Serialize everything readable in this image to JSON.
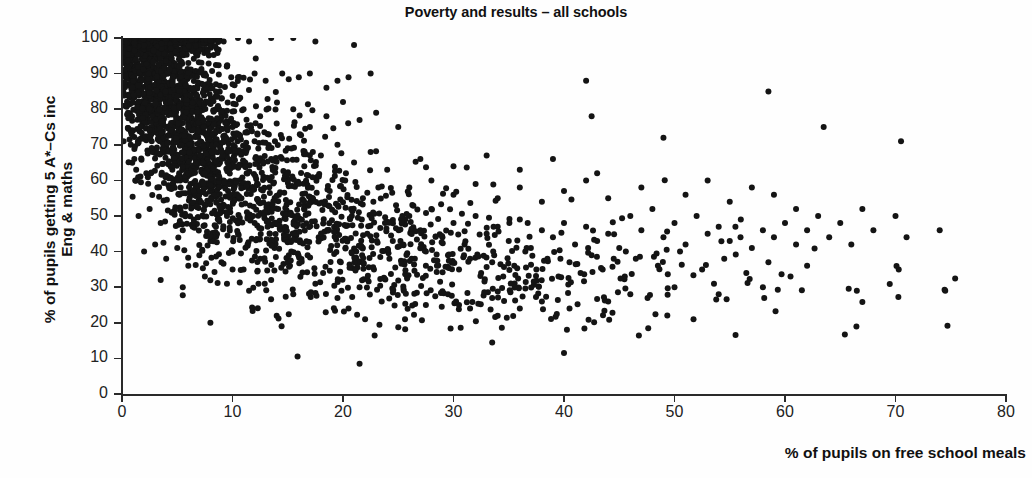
{
  "chart_data": {
    "type": "scatter",
    "title": "Poverty and results – all schools",
    "xlabel": "% of pupils on free school meals",
    "ylabel": "% of pupils getting 5 A*–Cs inc\nEng & maths",
    "xlim": [
      0,
      80
    ],
    "ylim": [
      0,
      100
    ],
    "xticks": [
      0,
      10,
      20,
      30,
      40,
      50,
      60,
      70,
      80
    ],
    "yticks": [
      0,
      10,
      20,
      30,
      40,
      50,
      60,
      70,
      80,
      90,
      100
    ],
    "grid": false,
    "legend": null,
    "marker": {
      "shape": "circle",
      "color": "#141414",
      "size_px": 6
    },
    "n_points_approx": 2900,
    "relationship": "strong negative correlation: school attainment falls as free-school-meal rate rises",
    "notes": [
      "Saturated band of points at y=100 for x between 0 and 6",
      "Dense cloud for x < 15 spanning y 30-100",
      "Main band narrows to y 30-55 for x between 25 and 45",
      "Sparse long tail of points out to x = 75 at y 28-75",
      "Low outliers near (21.5, 8.5), (33.5, 14.5) and (40, 11.5)"
    ],
    "points": [
      [
        0.2,
        100
      ],
      [
        0.4,
        100
      ],
      [
        0.6,
        100
      ],
      [
        0.8,
        100
      ],
      [
        1.0,
        100
      ],
      [
        1.2,
        100
      ],
      [
        1.4,
        100
      ],
      [
        1.6,
        100
      ],
      [
        1.8,
        100
      ],
      [
        2.0,
        100
      ],
      [
        2.2,
        100
      ],
      [
        2.4,
        100
      ],
      [
        2.6,
        100
      ],
      [
        2.8,
        100
      ],
      [
        3.0,
        100
      ],
      [
        3.2,
        100
      ],
      [
        3.4,
        100
      ],
      [
        3.6,
        100
      ],
      [
        3.8,
        100
      ],
      [
        4.0,
        100
      ],
      [
        4.2,
        100
      ],
      [
        4.4,
        100
      ],
      [
        4.6,
        100
      ],
      [
        4.8,
        100
      ],
      [
        5.0,
        100
      ],
      [
        5.2,
        100
      ],
      [
        5.4,
        100
      ],
      [
        5.6,
        100
      ],
      [
        5.8,
        100
      ],
      [
        6.0,
        100
      ],
      [
        6.4,
        100
      ],
      [
        7.0,
        100
      ],
      [
        7.6,
        100
      ],
      [
        8.4,
        100
      ],
      [
        9.2,
        99
      ],
      [
        10.5,
        100
      ],
      [
        11.5,
        99
      ],
      [
        13.5,
        100
      ],
      [
        15.5,
        100
      ],
      [
        17.5,
        99
      ],
      [
        21.0,
        98
      ],
      [
        0.4,
        94
      ],
      [
        1.2,
        96
      ],
      [
        2.0,
        97
      ],
      [
        2.8,
        95
      ],
      [
        3.6,
        96
      ],
      [
        4.4,
        94
      ],
      [
        5.2,
        95
      ],
      [
        6.0,
        93
      ],
      [
        6.8,
        96
      ],
      [
        0.5,
        84
      ],
      [
        1.5,
        90
      ],
      [
        2.5,
        88
      ],
      [
        3.5,
        91
      ],
      [
        4.5,
        86
      ],
      [
        5.5,
        89
      ],
      [
        6.5,
        85
      ],
      [
        7.5,
        90
      ],
      [
        8.5,
        87
      ],
      [
        9.5,
        92
      ],
      [
        10.5,
        89
      ],
      [
        12.0,
        90
      ],
      [
        13.0,
        88
      ],
      [
        14.5,
        90
      ],
      [
        16.0,
        89
      ],
      [
        17.0,
        90
      ],
      [
        18.5,
        86
      ],
      [
        19.5,
        88
      ],
      [
        20.5,
        89
      ],
      [
        22.5,
        90
      ],
      [
        1.0,
        74
      ],
      [
        2.0,
        80
      ],
      [
        3.0,
        78
      ],
      [
        4.0,
        82
      ],
      [
        5.0,
        76
      ],
      [
        6.0,
        79
      ],
      [
        7.0,
        81
      ],
      [
        8.0,
        77
      ],
      [
        9.0,
        83
      ],
      [
        10.0,
        75
      ],
      [
        11.0,
        80
      ],
      [
        12.5,
        78
      ],
      [
        14.0,
        76
      ],
      [
        15.5,
        80
      ],
      [
        17.0,
        75
      ],
      [
        18.5,
        78
      ],
      [
        20.0,
        82
      ],
      [
        21.5,
        77
      ],
      [
        23.0,
        79
      ],
      [
        25.0,
        75
      ],
      [
        0.8,
        70
      ],
      [
        1.8,
        72
      ],
      [
        2.8,
        68
      ],
      [
        3.8,
        71
      ],
      [
        4.8,
        66
      ],
      [
        5.8,
        69
      ],
      [
        6.8,
        73
      ],
      [
        7.8,
        67
      ],
      [
        8.8,
        70
      ],
      [
        9.8,
        65
      ],
      [
        11.0,
        68
      ],
      [
        12.0,
        71
      ],
      [
        13.5,
        66
      ],
      [
        15.0,
        69
      ],
      [
        16.5,
        64
      ],
      [
        18.0,
        67
      ],
      [
        19.5,
        70
      ],
      [
        21.0,
        65
      ],
      [
        22.5,
        68
      ],
      [
        24.0,
        63
      ],
      [
        1.2,
        60
      ],
      [
        2.2,
        62
      ],
      [
        3.2,
        58
      ],
      [
        4.2,
        61
      ],
      [
        5.2,
        56
      ],
      [
        6.2,
        59
      ],
      [
        7.2,
        63
      ],
      [
        8.2,
        57
      ],
      [
        9.2,
        60
      ],
      [
        10.2,
        55
      ],
      [
        11.5,
        58
      ],
      [
        12.8,
        61
      ],
      [
        14.2,
        56
      ],
      [
        15.8,
        59
      ],
      [
        17.2,
        54
      ],
      [
        18.8,
        57
      ],
      [
        20.2,
        60
      ],
      [
        21.8,
        55
      ],
      [
        23.2,
        58
      ],
      [
        24.8,
        53
      ],
      [
        1.5,
        50
      ],
      [
        2.5,
        52
      ],
      [
        3.5,
        48
      ],
      [
        4.5,
        51
      ],
      [
        5.5,
        46
      ],
      [
        6.5,
        49
      ],
      [
        7.5,
        53
      ],
      [
        8.5,
        47
      ],
      [
        9.5,
        50
      ],
      [
        10.5,
        45
      ],
      [
        12.0,
        48
      ],
      [
        13.2,
        51
      ],
      [
        14.8,
        46
      ],
      [
        16.2,
        49
      ],
      [
        17.8,
        44
      ],
      [
        19.2,
        47
      ],
      [
        20.8,
        50
      ],
      [
        22.2,
        45
      ],
      [
        23.8,
        48
      ],
      [
        25.2,
        43
      ],
      [
        2.0,
        40
      ],
      [
        3.0,
        42
      ],
      [
        4.0,
        38
      ],
      [
        5.0,
        41
      ],
      [
        6.0,
        36
      ],
      [
        7.0,
        39
      ],
      [
        8.0,
        43
      ],
      [
        9.0,
        37
      ],
      [
        10.0,
        40
      ],
      [
        11.0,
        35
      ],
      [
        12.5,
        38
      ],
      [
        13.8,
        41
      ],
      [
        15.2,
        36
      ],
      [
        16.8,
        39
      ],
      [
        18.2,
        34
      ],
      [
        19.8,
        37
      ],
      [
        21.2,
        40
      ],
      [
        22.8,
        35
      ],
      [
        24.2,
        38
      ],
      [
        25.8,
        33
      ],
      [
        3.5,
        32
      ],
      [
        5.5,
        30
      ],
      [
        7.5,
        33
      ],
      [
        9.5,
        31
      ],
      [
        11.5,
        29
      ],
      [
        13.5,
        32
      ],
      [
        15.5,
        28
      ],
      [
        17.5,
        31
      ],
      [
        19.5,
        27
      ],
      [
        21.5,
        30
      ],
      [
        23.5,
        26
      ],
      [
        25.5,
        29
      ],
      [
        27.5,
        25
      ],
      [
        29.5,
        28
      ],
      [
        31.5,
        24
      ],
      [
        33.5,
        27
      ],
      [
        8.0,
        20
      ],
      [
        14.0,
        22
      ],
      [
        20.5,
        24
      ],
      [
        22.0,
        21
      ],
      [
        21.5,
        8.5
      ],
      [
        33.5,
        14.5
      ],
      [
        40.0,
        11.5
      ],
      [
        26.0,
        50
      ],
      [
        27.0,
        46
      ],
      [
        28.0,
        52
      ],
      [
        29.0,
        44
      ],
      [
        30.0,
        48
      ],
      [
        31.0,
        42
      ],
      [
        32.0,
        50
      ],
      [
        33.0,
        45
      ],
      [
        34.0,
        47
      ],
      [
        35.0,
        43
      ],
      [
        36.0,
        49
      ],
      [
        37.0,
        41
      ],
      [
        38.0,
        46
      ],
      [
        39.0,
        44
      ],
      [
        40.0,
        48
      ],
      [
        41.0,
        42
      ],
      [
        42.0,
        47
      ],
      [
        43.0,
        43
      ],
      [
        44.0,
        45
      ],
      [
        45.0,
        41
      ],
      [
        26.5,
        38
      ],
      [
        27.5,
        40
      ],
      [
        28.5,
        36
      ],
      [
        29.5,
        39
      ],
      [
        30.5,
        35
      ],
      [
        31.5,
        38
      ],
      [
        32.5,
        34
      ],
      [
        33.5,
        37
      ],
      [
        34.5,
        33
      ],
      [
        35.5,
        36
      ],
      [
        36.5,
        40
      ],
      [
        37.5,
        35
      ],
      [
        38.5,
        38
      ],
      [
        39.5,
        33
      ],
      [
        40.5,
        37
      ],
      [
        41.5,
        34
      ],
      [
        42.5,
        39
      ],
      [
        43.5,
        35
      ],
      [
        44.5,
        38
      ],
      [
        45.5,
        33
      ],
      [
        26.0,
        58
      ],
      [
        28.0,
        60
      ],
      [
        30.0,
        56
      ],
      [
        32.0,
        59
      ],
      [
        34.0,
        55
      ],
      [
        36.0,
        58
      ],
      [
        38.0,
        54
      ],
      [
        40.0,
        57
      ],
      [
        42.0,
        60
      ],
      [
        44.0,
        55
      ],
      [
        27.0,
        66
      ],
      [
        30.0,
        64
      ],
      [
        33.0,
        67
      ],
      [
        36.0,
        63
      ],
      [
        39.0,
        66
      ],
      [
        42.0,
        88
      ],
      [
        42.5,
        78
      ],
      [
        43.0,
        62
      ],
      [
        46.0,
        50
      ],
      [
        47.0,
        46
      ],
      [
        48.0,
        52
      ],
      [
        49.0,
        44
      ],
      [
        50.0,
        48
      ],
      [
        51.0,
        42
      ],
      [
        52.0,
        50
      ],
      [
        53.0,
        45
      ],
      [
        54.0,
        47
      ],
      [
        55.0,
        43
      ],
      [
        56.0,
        49
      ],
      [
        57.0,
        41
      ],
      [
        58.0,
        46
      ],
      [
        59.0,
        44
      ],
      [
        60.0,
        48
      ],
      [
        61.0,
        42
      ],
      [
        46.5,
        38
      ],
      [
        48.5,
        36
      ],
      [
        50.5,
        40
      ],
      [
        52.5,
        35
      ],
      [
        54.5,
        38
      ],
      [
        56.5,
        34
      ],
      [
        58.5,
        37
      ],
      [
        60.5,
        33
      ],
      [
        47.0,
        58
      ],
      [
        49.0,
        72
      ],
      [
        51.0,
        56
      ],
      [
        53.0,
        60
      ],
      [
        55.0,
        54
      ],
      [
        57.0,
        58
      ],
      [
        58.5,
        85
      ],
      [
        59.0,
        56
      ],
      [
        61.0,
        52
      ],
      [
        62.0,
        46
      ],
      [
        63.0,
        50
      ],
      [
        63.5,
        75
      ],
      [
        64.0,
        44
      ],
      [
        65.0,
        48
      ],
      [
        66.0,
        42
      ],
      [
        67.0,
        52
      ],
      [
        68.0,
        46
      ],
      [
        70.0,
        50
      ],
      [
        70.5,
        71
      ],
      [
        71.0,
        44
      ],
      [
        74.0,
        46
      ],
      [
        74.5,
        29
      ],
      [
        66.5,
        29
      ],
      [
        62.0,
        36
      ],
      [
        58.0,
        30
      ],
      [
        54.0,
        28
      ],
      [
        50.0,
        30
      ],
      [
        46.0,
        28
      ],
      [
        44.0,
        26
      ],
      [
        40.5,
        24
      ],
      [
        38.0,
        26
      ],
      [
        36.0,
        24
      ],
      [
        34.0,
        22
      ],
      [
        30.5,
        25
      ]
    ]
  }
}
